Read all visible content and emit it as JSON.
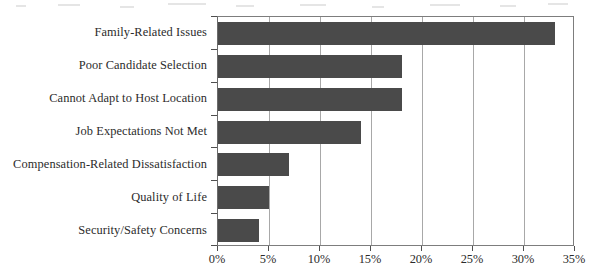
{
  "chart_data": {
    "type": "bar",
    "orientation": "horizontal",
    "title": "",
    "subtitle": "",
    "xlabel": "",
    "ylabel": "",
    "categories": [
      "Family-Related Issues",
      "Poor Candidate Selection",
      "Cannot Adapt to Host Location",
      "Job Expectations Not Met",
      "Compensation-Related Dissatisfaction",
      "Quality of Life",
      "Security/Safety Concerns"
    ],
    "values": [
      33,
      18,
      18,
      14,
      7,
      5,
      4
    ],
    "value_unit": "%",
    "xlim": [
      0,
      35
    ],
    "xticks": [
      0,
      5,
      10,
      15,
      20,
      25,
      30,
      35
    ],
    "xtick_labels": [
      "0%",
      "5%",
      "10%",
      "15%",
      "20%",
      "25%",
      "30%",
      "35%"
    ],
    "grid": "vertical",
    "legend": "none",
    "series": [
      {
        "name": "Share of respondents",
        "color": "#4a4a4a",
        "values": [
          33,
          18,
          18,
          14,
          7,
          5,
          4
        ]
      }
    ],
    "colors": {
      "bar": "#4a4a4a",
      "gridline": "#a8a8a8",
      "axis": "#6b6b6b",
      "text": "#2b2b2b",
      "background": "#ffffff"
    }
  }
}
